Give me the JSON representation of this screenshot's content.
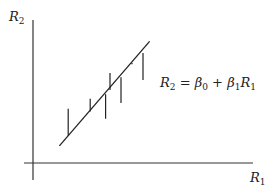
{
  "diagram": {
    "y_axis_label": {
      "main": "R",
      "sub": "2"
    },
    "x_axis_label": {
      "main": "R",
      "sub": "1"
    },
    "equation": {
      "lhs_main": "R",
      "lhs_sub": "2",
      "eq": " = ",
      "b0_main": "β",
      "b0_sub": "0",
      "plus": " + ",
      "b1_main": "β",
      "b1_sub": "1",
      "r1_main": "R",
      "r1_sub": "1"
    },
    "regression_line": {
      "x_start": 0.12,
      "y_start": 0.12,
      "x_end": 0.53,
      "y_end": 0.85
    },
    "residuals": [
      {
        "x": 0.16,
        "y_obs": 0.38,
        "y_fit": 0.19
      },
      {
        "x": 0.26,
        "y_obs": 0.45,
        "y_fit": 0.36
      },
      {
        "x": 0.33,
        "y_obs": 0.31,
        "y_fit": 0.48
      },
      {
        "x": 0.35,
        "y_obs": 0.63,
        "y_fit": 0.51
      },
      {
        "x": 0.4,
        "y_obs": 0.42,
        "y_fit": 0.6
      },
      {
        "x": 0.45,
        "y_obs": 0.7,
        "y_fit": 0.69
      },
      {
        "x": 0.5,
        "y_obs": 0.58,
        "y_fit": 0.77
      }
    ],
    "colors": {
      "ink": "#222222",
      "background": "#ffffff"
    }
  }
}
